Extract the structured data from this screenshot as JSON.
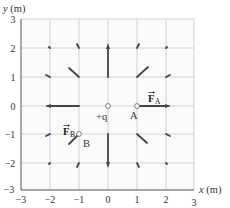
{
  "diagram": {
    "type": "electric-field-vector-diagram",
    "axes": {
      "x_label": "x (m)",
      "y_label": "y (m)",
      "x_ticks": [
        "−3",
        "−2",
        "−1",
        "0",
        "1",
        "2",
        "3"
      ],
      "y_ticks": [
        "3",
        "2",
        "1",
        "0",
        "−1",
        "−2",
        "−3"
      ],
      "x_range": [
        -3,
        3
      ],
      "y_range": [
        -3,
        3
      ],
      "grid": true
    },
    "charge": {
      "label": "+q",
      "x": 0,
      "y": 0
    },
    "points": [
      {
        "name": "A",
        "label": "A",
        "x": 1,
        "y": 0
      },
      {
        "name": "B",
        "label": "B",
        "x": -1,
        "y": -1
      }
    ],
    "force_labels": [
      {
        "name": "F_A",
        "symbol": "F",
        "subscript": "A"
      },
      {
        "name": "F_B",
        "symbol": "F",
        "subscript": "B"
      }
    ],
    "field_vectors": [
      {
        "x": 0,
        "y": 2,
        "dx": 0,
        "dy": 1,
        "length": "long"
      },
      {
        "x": 1,
        "y": 1,
        "dx": 1,
        "dy": 1,
        "length": "medium"
      },
      {
        "x": -1,
        "y": 1,
        "dx": -1,
        "dy": 1,
        "length": "medium"
      },
      {
        "x": 1,
        "y": 0,
        "dx": 1,
        "dy": 0,
        "length": "long",
        "label": "F_A"
      },
      {
        "x": -1,
        "y": 0,
        "dx": -1,
        "dy": 0,
        "length": "long"
      },
      {
        "x": 0,
        "y": -1,
        "dx": 0,
        "dy": -1,
        "length": "long"
      },
      {
        "x": -1,
        "y": -1,
        "dx": -1,
        "dy": -1,
        "length": "medium",
        "label": "F_B"
      },
      {
        "x": 1,
        "y": -1,
        "dx": 1,
        "dy": -1,
        "length": "medium"
      },
      {
        "x": 1,
        "y": 2,
        "dx": 1,
        "dy": 2,
        "length": "short"
      },
      {
        "x": -1,
        "y": 2,
        "dx": -1,
        "dy": 2,
        "length": "short"
      },
      {
        "x": 2,
        "y": 2,
        "dx": 1,
        "dy": 1,
        "length": "tiny"
      },
      {
        "x": -2,
        "y": 2,
        "dx": -1,
        "dy": 1,
        "length": "tiny"
      },
      {
        "x": 2,
        "y": 1,
        "dx": 2,
        "dy": 1,
        "length": "short"
      },
      {
        "x": -2,
        "y": 1,
        "dx": -2,
        "dy": 1,
        "length": "short"
      },
      {
        "x": 2,
        "y": -1,
        "dx": 2,
        "dy": -1,
        "length": "short"
      },
      {
        "x": -2,
        "y": -1,
        "dx": -2,
        "dy": -1,
        "length": "short"
      },
      {
        "x": 1,
        "y": -2,
        "dx": 1,
        "dy": -2,
        "length": "short"
      },
      {
        "x": -1,
        "y": -2,
        "dx": -1,
        "dy": -2,
        "length": "short"
      },
      {
        "x": 2,
        "y": -2,
        "dx": 1,
        "dy": -1,
        "length": "tiny"
      },
      {
        "x": -2,
        "y": -2,
        "dx": -1,
        "dy": -1,
        "length": "tiny"
      }
    ]
  }
}
